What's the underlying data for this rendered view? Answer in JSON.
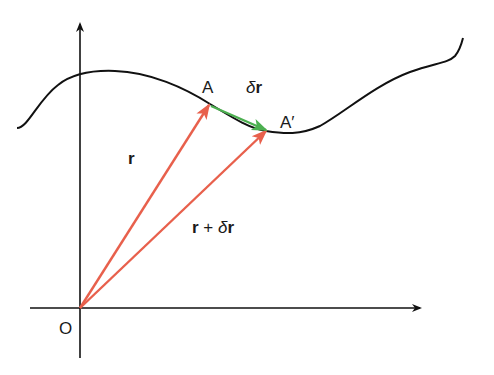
{
  "diagram": {
    "labels": {
      "origin": "O",
      "point_a": "A",
      "point_a_prime": "A′",
      "r": "r",
      "delta_symbol": "δ",
      "delta_r_vec": "r",
      "r_plus_delta_r_r": "r",
      "r_plus_delta_r_plus": " + ",
      "r_plus_delta_r_delta": "δ",
      "r_plus_delta_r_r2": "r"
    },
    "colors": {
      "curve": "#111111",
      "axes": "#111111",
      "position_vectors": "#e8604c",
      "displacement_vector": "#4caf50",
      "background": "#ffffff"
    }
  }
}
